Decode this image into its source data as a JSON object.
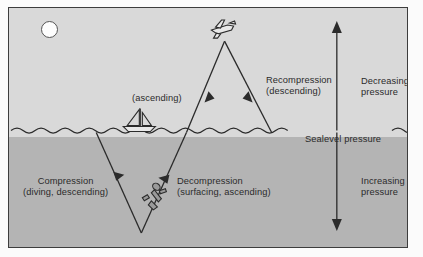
{
  "figure": {
    "background_colors": {
      "sky": "#d9d9d9",
      "sea": "#b4b4b4",
      "frame_border": "#3d3d3d",
      "page": "#ffffff",
      "ink": "#2b2b2b"
    }
  },
  "waterline": {
    "label": "Sealevel pressure"
  },
  "segments": {
    "compression": {
      "line1": "Compression",
      "line2": "(diving, descending)"
    },
    "decompression": {
      "line1": "Decompression",
      "line2": "(surfacing, ascending)"
    },
    "ascending": {
      "line1": "(ascending)"
    },
    "recompression": {
      "line1": "Recompression",
      "line2": "(descending)"
    }
  },
  "pressure_axis": {
    "above": {
      "line1": "Decreasing",
      "line2": "pressure",
      "arrow": "up-arrow-icon"
    },
    "below": {
      "line1": "Increasing",
      "line2": "pressure",
      "arrow": "down-arrow-icon"
    }
  },
  "icons": {
    "sun": "sun-icon",
    "airplane": "airplane-icon",
    "sailboat": "sailboat-icon",
    "diver": "scuba-diver-icon"
  }
}
